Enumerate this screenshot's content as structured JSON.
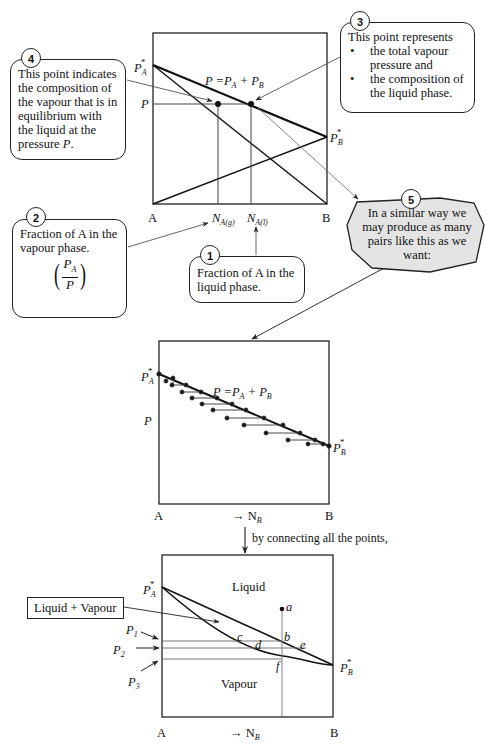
{
  "diagram_title": "Construction of a pressure–composition phase diagram for an ideal binary mixture A–B",
  "callouts": {
    "c1": {
      "number": "1",
      "text": "Fraction of A in the liquid phase."
    },
    "c2": {
      "number": "2",
      "text": "Fraction of A in the vapour phase.",
      "fraction_num": "P",
      "fraction_num_sub": "A",
      "fraction_den": "P"
    },
    "c3": {
      "number": "3",
      "heading": "This point represents",
      "bullets": [
        "the total vapour pressure and",
        "the composition of the liquid phase."
      ]
    },
    "c4": {
      "number": "4",
      "text_prefix": "This point indicates the composition of the vapour that is in equilibrium with the liquid at the pressure ",
      "text_var": "P",
      "text_suffix": "."
    },
    "c5": {
      "number": "5",
      "text": "In a similar way we may produce as many pairs like this as we want:"
    }
  },
  "chart1": {
    "y_top_label": "P",
    "y_top_label_sub": "A",
    "y_top_star": "*",
    "y_mid_label": "P",
    "right_label": "P",
    "right_label_sub": "B",
    "right_star": "*",
    "line_label": "P =P",
    "line_label_sub1": "A",
    "line_label_plus": " + P",
    "line_label_sub2": "B",
    "x_left": "A",
    "x_right": "B",
    "x_tick1": "N",
    "x_tick1_sub": "A(g)",
    "x_tick2": "N",
    "x_tick2_sub": "A(l)"
  },
  "chart2": {
    "y_top_label": "P",
    "y_top_label_sub": "A",
    "y_top_star": "*",
    "y_mid_label": "P",
    "right_label": "P",
    "right_label_sub": "B",
    "right_star": "*",
    "line_label": "P =P",
    "line_label_sub1": "A",
    "line_label_plus": " + P",
    "line_label_sub2": "B",
    "x_left": "A",
    "x_mid": "→ N",
    "x_mid_sub": "B",
    "x_right": "B"
  },
  "connector_caption": "by connecting all the points,",
  "chart3": {
    "region_liquid": "Liquid",
    "region_vapour": "Vapour",
    "region_two_phase_box": "Liquid + Vapour",
    "y_top_label": "P",
    "y_top_label_sub": "A",
    "y_top_star": "*",
    "right_label": "P",
    "right_label_sub": "B",
    "right_star": "*",
    "pressures": [
      {
        "label": "P",
        "sub": "1"
      },
      {
        "label": "P",
        "sub": "2"
      },
      {
        "label": "P",
        "sub": "3"
      }
    ],
    "points": [
      "a",
      "b",
      "c",
      "d",
      "e",
      "f"
    ],
    "x_left": "A",
    "x_mid": "→ N",
    "x_mid_sub": "B",
    "x_right": "B"
  }
}
